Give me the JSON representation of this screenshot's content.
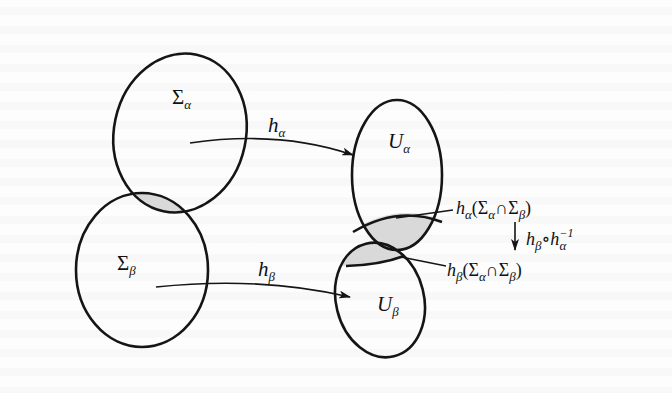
{
  "diagram": {
    "type": "chart-transition-map",
    "colors": {
      "stroke": "#151515",
      "overlap_fill": "#d9d9d9",
      "background": "#fdfdfd"
    },
    "sets": {
      "sigma_alpha": {
        "base": "Σ",
        "sub": "α"
      },
      "sigma_beta": {
        "base": "Σ",
        "sub": "β"
      },
      "u_alpha": {
        "base": "U",
        "sub": "α"
      },
      "u_beta": {
        "base": "U",
        "sub": "β"
      }
    },
    "maps": {
      "h_alpha": {
        "base": "h",
        "sub": "α"
      },
      "h_beta": {
        "base": "h",
        "sub": "β"
      },
      "transition": {
        "left": "h",
        "left_sub": "β",
        "op": "∘",
        "right": "h",
        "right_sub": "α",
        "right_sup": "−1"
      }
    },
    "image_labels": {
      "alpha": {
        "fn": "h",
        "fn_sub": "α",
        "open": "(",
        "a": "Σ",
        "a_sub": "α",
        "cap": "∩",
        "b": "Σ",
        "b_sub": "β",
        "close": ")"
      },
      "beta": {
        "fn": "h",
        "fn_sub": "β",
        "open": "(",
        "a": "Σ",
        "a_sub": "α",
        "cap": "∩",
        "b": "Σ",
        "b_sub": "β",
        "close": ")"
      }
    }
  }
}
